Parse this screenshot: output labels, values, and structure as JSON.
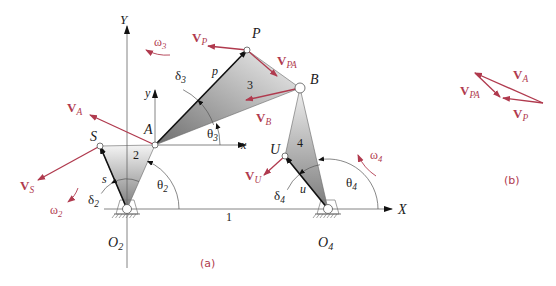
{
  "colors": {
    "vector": "#b03a4e",
    "ink": "#1a1a1a",
    "axis": "#333333",
    "light": "#888888",
    "link_dark": "#8a8a8a",
    "link_light": "#f2f2f2"
  },
  "subfigures": {
    "a": {
      "caption": "(a)",
      "caption_pos": [
        200,
        267
      ]
    },
    "b": {
      "caption": "(b)",
      "caption_pos": [
        504,
        184
      ]
    }
  },
  "axes": {
    "ground": {
      "from": [
        104,
        209
      ],
      "to": [
        392,
        209
      ],
      "label": "X",
      "label_pos": [
        398,
        214
      ]
    },
    "Y": {
      "from": [
        127,
        268
      ],
      "to": [
        127,
        26
      ],
      "label": "Y",
      "label_pos": [
        120,
        24
      ]
    },
    "local_x": {
      "from": [
        155,
        145
      ],
      "to": [
        246,
        145
      ],
      "label": "x",
      "label_pos": [
        241,
        149
      ]
    },
    "local_y": {
      "from": [
        155,
        145
      ],
      "to": [
        155,
        90
      ],
      "label": "y",
      "label_pos": [
        145,
        97
      ]
    },
    "ground_label": {
      "text": "1",
      "pos": [
        226,
        221
      ]
    }
  },
  "points": {
    "O2": {
      "label": "O",
      "sub": "2",
      "xy": [
        127,
        209
      ],
      "label_pos": [
        108,
        247
      ]
    },
    "A": {
      "label": "A",
      "xy": [
        155,
        145
      ],
      "label_pos": [
        144,
        134
      ]
    },
    "S": {
      "label": "S",
      "xy": [
        100,
        146
      ],
      "label_pos": [
        90,
        141
      ]
    },
    "P": {
      "label": "P",
      "xy": [
        247,
        50
      ],
      "label_pos": [
        252,
        38
      ]
    },
    "B": {
      "label": "B",
      "xy": [
        300,
        88
      ],
      "label_pos": [
        310,
        84
      ]
    },
    "U": {
      "label": "U",
      "xy": [
        285,
        156
      ],
      "label_pos": [
        270,
        154
      ]
    },
    "O4": {
      "label": "O",
      "sub": "4",
      "xy": [
        328,
        209
      ],
      "label_pos": [
        318,
        247
      ]
    }
  },
  "links": [
    {
      "id": "2",
      "label": "2",
      "label_pos": [
        133,
        159
      ],
      "vertices": [
        [
          127,
          209
        ],
        [
          100,
          146
        ],
        [
          155,
          145
        ]
      ]
    },
    {
      "id": "3",
      "label": "3",
      "label_pos": [
        247,
        89
      ],
      "vertices": [
        [
          155,
          145
        ],
        [
          247,
          50
        ],
        [
          300,
          88
        ]
      ]
    },
    {
      "id": "4",
      "label": "4",
      "label_pos": [
        297,
        147
      ],
      "vertices": [
        [
          328,
          209
        ],
        [
          285,
          156
        ],
        [
          300,
          88
        ]
      ]
    }
  ],
  "position_vectors": [
    {
      "name": "s",
      "label": "s",
      "from": [
        127,
        209
      ],
      "to": [
        100,
        146
      ],
      "label_pos": [
        102,
        183
      ]
    },
    {
      "name": "p",
      "label": "p",
      "from": [
        155,
        145
      ],
      "to": [
        247,
        50
      ],
      "label_pos": [
        212,
        75
      ]
    },
    {
      "name": "u",
      "label": "u",
      "from": [
        328,
        209
      ],
      "to": [
        285,
        156
      ],
      "label_pos": [
        300,
        193
      ]
    }
  ],
  "angles": [
    {
      "label": "δ",
      "sub": "2",
      "label_pos": [
        88,
        204
      ]
    },
    {
      "label": "θ",
      "sub": "2",
      "label_pos": [
        157,
        189
      ]
    },
    {
      "label": "δ",
      "sub": "3",
      "label_pos": [
        175,
        80
      ]
    },
    {
      "label": "θ",
      "sub": "3",
      "label_pos": [
        207,
        138
      ]
    },
    {
      "label": "δ",
      "sub": "4",
      "label_pos": [
        274,
        200
      ]
    },
    {
      "label": "θ",
      "sub": "4",
      "label_pos": [
        346,
        187
      ]
    }
  ],
  "velocity_vectors": [
    {
      "label": "V",
      "sub": "P",
      "from": [
        247,
        50
      ],
      "to": [
        208,
        46
      ],
      "label_pos": [
        192,
        42
      ]
    },
    {
      "label": "V",
      "sub": "PA",
      "from": [
        247,
        50
      ],
      "to": [
        277,
        76
      ],
      "label_pos": [
        277,
        65
      ]
    },
    {
      "label": "V",
      "sub": "A",
      "from": [
        155,
        145
      ],
      "to": [
        90,
        115
      ],
      "label_pos": [
        67,
        112
      ]
    },
    {
      "label": "V",
      "sub": "B",
      "from": [
        300,
        88
      ],
      "to": [
        246,
        100
      ],
      "label_pos": [
        256,
        122
      ]
    },
    {
      "label": "V",
      "sub": "S",
      "from": [
        100,
        146
      ],
      "to": [
        38,
        180
      ],
      "label_pos": [
        20,
        190
      ]
    },
    {
      "label": "V",
      "sub": "U",
      "from": [
        285,
        156
      ],
      "to": [
        264,
        175
      ],
      "label_pos": [
        245,
        180
      ]
    }
  ],
  "angular_velocities": [
    {
      "label": "ω",
      "sub": "3",
      "label_pos": [
        154,
        46
      ],
      "arc_from": [
        170,
        55
      ],
      "arc_to": [
        146,
        50
      ]
    },
    {
      "label": "ω",
      "sub": "2",
      "label_pos": [
        50,
        214
      ],
      "arc_from": [
        78,
        188
      ],
      "arc_to": [
        68,
        202
      ]
    },
    {
      "label": "ω",
      "sub": "4",
      "label_pos": [
        370,
        159
      ],
      "arc_from": [
        376,
        176
      ],
      "arc_to": [
        358,
        155
      ]
    }
  ],
  "polygon_b": {
    "vectors": [
      {
        "label": "V",
        "sub": "A",
        "from": [
          543,
          103
        ],
        "to": [
          475,
          73
        ],
        "label_pos": [
          513,
          79
        ]
      },
      {
        "label": "V",
        "sub": "PA",
        "from": [
          475,
          73
        ],
        "to": [
          500,
          97
        ],
        "label_pos": [
          460,
          95
        ]
      },
      {
        "label": "V",
        "sub": "P",
        "from": [
          543,
          103
        ],
        "to": [
          503,
          98
        ],
        "label_pos": [
          513,
          118
        ]
      }
    ]
  }
}
